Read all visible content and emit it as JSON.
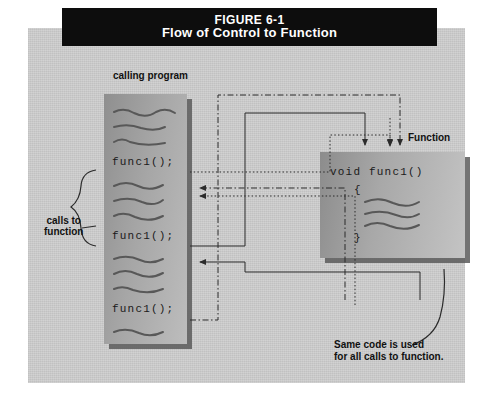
{
  "figure": {
    "caption_number": "FIGURE 6-1",
    "caption_title": "Flow of Control to Function"
  },
  "labels": {
    "calling_program": "calling program",
    "function": "Function",
    "calls_to_function_line1": "calls to",
    "calls_to_function_line2": "function",
    "same_code_line1": "Same code is used",
    "same_code_line2": "for all calls to function."
  },
  "calling_program_box": {
    "call_1": "func1();",
    "call_2": "func1();",
    "call_3": "func1();"
  },
  "function_box": {
    "signature": "void func1()",
    "open_brace": "{",
    "close_brace": "}"
  },
  "colors": {
    "caption_bar_background": "#0d0d0d",
    "caption_bar_text": "#ffffff",
    "panel_background": "#c9c9c9",
    "box_shadow": "#5a5a5a",
    "line_color": "#2b2b2b",
    "text_color": "#111111"
  }
}
